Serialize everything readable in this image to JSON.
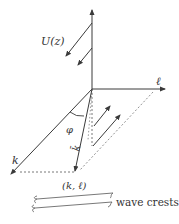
{
  "diagram": {
    "labels": {
      "U": "U(z)",
      "ell": "ℓ",
      "k": "k",
      "phi": "φ",
      "kbar": "k̄",
      "point": "(k, ℓ)",
      "crests": "wave crests"
    },
    "colors": {
      "line": "#3a3a3a",
      "dashed": "#555555",
      "background": "#ffffff"
    }
  }
}
